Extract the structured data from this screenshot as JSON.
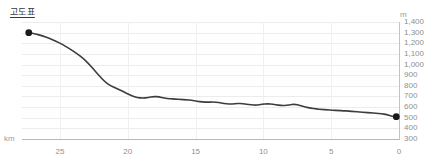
{
  "chart_title": "고도표",
  "axis": {
    "y_unit": "m",
    "x_unit": "km"
  },
  "chart_data": {
    "type": "line",
    "title": "고도표",
    "xlabel": "km",
    "ylabel": "m",
    "xlim": [
      27.8,
      0
    ],
    "ylim": [
      300,
      1400
    ],
    "x_reversed": true,
    "grid": true,
    "legend": null,
    "x_ticks": [
      25,
      20,
      15,
      10,
      5,
      0
    ],
    "x_tick_labels": [
      "25",
      "20",
      "15",
      "10",
      "5",
      "0"
    ],
    "y_ticks": [
      300,
      400,
      500,
      600,
      700,
      800,
      900,
      1000,
      1100,
      1200,
      1300,
      1400
    ],
    "y_tick_labels": [
      "300",
      "400",
      "500",
      "600",
      "700",
      "800",
      "900",
      "1,000",
      "1,100",
      "1,200",
      "1,300",
      "1,400"
    ],
    "line_color": "#3d3d3d",
    "marker_color": "#1a1a1a",
    "markers": [
      {
        "name": "start-point",
        "x": 27.3,
        "y": 1300
      },
      {
        "name": "end-point",
        "x": 0.2,
        "y": 510
      }
    ],
    "series": [
      {
        "name": "elevation",
        "x": [
          27.3,
          26.8,
          26.3,
          25.8,
          25.3,
          24.8,
          24.3,
          23.8,
          23.3,
          22.9,
          22.5,
          22.1,
          21.7,
          21.3,
          20.9,
          20.5,
          20.1,
          19.7,
          19.3,
          18.9,
          18.5,
          18.1,
          17.7,
          17.3,
          16.9,
          16.5,
          16.1,
          15.7,
          15.3,
          14.9,
          14.5,
          14.1,
          13.7,
          13.3,
          12.9,
          12.5,
          12.1,
          11.7,
          11.3,
          10.9,
          10.5,
          10.1,
          9.7,
          9.3,
          8.9,
          8.5,
          8.1,
          7.7,
          7.3,
          6.9,
          6.5,
          6.1,
          5.7,
          5.3,
          4.9,
          4.5,
          4.1,
          3.7,
          3.3,
          2.9,
          2.5,
          2.1,
          1.7,
          1.3,
          0.9,
          0.5,
          0.2
        ],
        "y": [
          1300,
          1288,
          1270,
          1248,
          1220,
          1188,
          1150,
          1108,
          1060,
          1010,
          952,
          893,
          840,
          802,
          780,
          757,
          730,
          706,
          690,
          684,
          690,
          700,
          696,
          684,
          678,
          676,
          672,
          668,
          664,
          655,
          648,
          646,
          648,
          643,
          634,
          628,
          630,
          636,
          628,
          620,
          618,
          626,
          632,
          626,
          618,
          614,
          620,
          628,
          616,
          600,
          590,
          582,
          578,
          574,
          570,
          568,
          566,
          562,
          558,
          554,
          550,
          546,
          542,
          538,
          530,
          514,
          510
        ]
      }
    ]
  }
}
